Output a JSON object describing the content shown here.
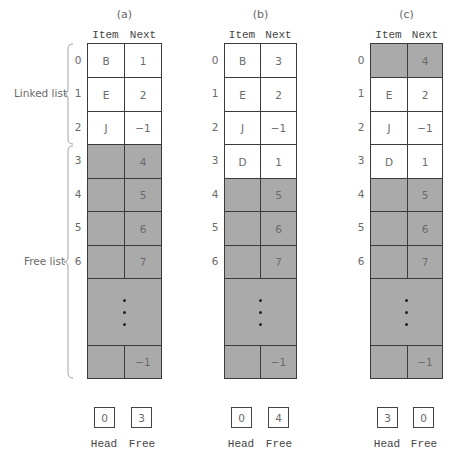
{
  "labels": {
    "linked_list": "Linked list",
    "free_list": "Free list",
    "item_header": "Item",
    "next_header": "Next",
    "head_label": "Head",
    "free_label": "Free"
  },
  "colors": {
    "shaded_cell": "#aaaaaa",
    "border": "#3a3a3a",
    "text": "#6a6a6a"
  },
  "panels": [
    {
      "caption": "(a)",
      "rows": [
        {
          "index": "0",
          "item": "B",
          "next": "1",
          "shaded": false
        },
        {
          "index": "1",
          "item": "E",
          "next": "2",
          "shaded": false
        },
        {
          "index": "2",
          "item": "J",
          "next": "−1",
          "shaded": false
        },
        {
          "index": "3",
          "item": "",
          "next": "4",
          "shaded": true
        },
        {
          "index": "4",
          "item": "",
          "next": "5",
          "shaded": true
        },
        {
          "index": "5",
          "item": "",
          "next": "6",
          "shaded": true
        },
        {
          "index": "6",
          "item": "",
          "next": "7",
          "shaded": true
        }
      ],
      "ellipsis": "⋮",
      "last_row": {
        "item": "",
        "next": "−1",
        "shaded": true
      },
      "head": "0",
      "free": "3"
    },
    {
      "caption": "(b)",
      "rows": [
        {
          "index": "0",
          "item": "B",
          "next": "3",
          "shaded": false
        },
        {
          "index": "1",
          "item": "E",
          "next": "2",
          "shaded": false
        },
        {
          "index": "2",
          "item": "J",
          "next": "−1",
          "shaded": false
        },
        {
          "index": "3",
          "item": "D",
          "next": "1",
          "shaded": false
        },
        {
          "index": "4",
          "item": "",
          "next": "5",
          "shaded": true
        },
        {
          "index": "5",
          "item": "",
          "next": "6",
          "shaded": true
        },
        {
          "index": "6",
          "item": "",
          "next": "7",
          "shaded": true
        }
      ],
      "ellipsis": "⋮",
      "last_row": {
        "item": "",
        "next": "−1",
        "shaded": true
      },
      "head": "0",
      "free": "4"
    },
    {
      "caption": "(c)",
      "rows": [
        {
          "index": "0",
          "item": "",
          "next": "4",
          "shaded": true
        },
        {
          "index": "1",
          "item": "E",
          "next": "2",
          "shaded": false
        },
        {
          "index": "2",
          "item": "J",
          "next": "−1",
          "shaded": false
        },
        {
          "index": "3",
          "item": "D",
          "next": "1",
          "shaded": false
        },
        {
          "index": "4",
          "item": "",
          "next": "5",
          "shaded": true
        },
        {
          "index": "5",
          "item": "",
          "next": "6",
          "shaded": true
        },
        {
          "index": "6",
          "item": "",
          "next": "7",
          "shaded": true
        }
      ],
      "ellipsis": "⋮",
      "last_row": {
        "item": "",
        "next": "−1",
        "shaded": true
      },
      "head": "3",
      "free": "0"
    }
  ]
}
